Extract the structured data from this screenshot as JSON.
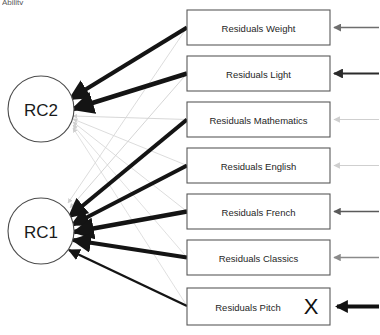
{
  "diagram": {
    "type": "factor-analysis-path-diagram",
    "top_clipped_fragment": "Ability",
    "latent_factors": [
      {
        "id": "RC2",
        "label": "RC2",
        "cx": 41,
        "cy": 109,
        "r": 33
      },
      {
        "id": "RC1",
        "label": "RC1",
        "cx": 41,
        "cy": 231,
        "r": 33
      }
    ],
    "manifest_variables": [
      {
        "id": "weight",
        "label": "Residuals Weight",
        "x": 187,
        "y": 10,
        "w": 143,
        "h": 35
      },
      {
        "id": "light",
        "label": "Residuals Light",
        "x": 187,
        "y": 56,
        "w": 143,
        "h": 35
      },
      {
        "id": "mathematics",
        "label": "Residuals Mathematics",
        "x": 187,
        "y": 102,
        "w": 143,
        "h": 35
      },
      {
        "id": "english",
        "label": "Residuals English",
        "x": 187,
        "y": 148,
        "w": 143,
        "h": 35
      },
      {
        "id": "french",
        "label": "Residuals French",
        "x": 187,
        "y": 194,
        "w": 143,
        "h": 35
      },
      {
        "id": "classics",
        "label": "Residuals Classics",
        "x": 187,
        "y": 240,
        "w": 143,
        "h": 35
      },
      {
        "id": "pitch",
        "label": "Residuals Pitch",
        "x": 187,
        "y": 288,
        "w": 143,
        "h": 37,
        "extra_glyph": "X"
      }
    ],
    "residual_arrows": [
      {
        "target": "weight",
        "color": "#6e6e6e",
        "width": 1.6,
        "y": 28
      },
      {
        "target": "light",
        "color": "#2b2b2b",
        "width": 2.2,
        "y": 74
      },
      {
        "target": "mathematics",
        "color": "#cfcfcf",
        "width": 1.2,
        "y": 120
      },
      {
        "target": "english",
        "color": "#cfcfcf",
        "width": 1.2,
        "y": 166
      },
      {
        "target": "french",
        "color": "#5a5a5a",
        "width": 1.5,
        "y": 212
      },
      {
        "target": "classics",
        "color": "#8a8a8a",
        "width": 1.5,
        "y": 258
      },
      {
        "target": "pitch",
        "color": "#111111",
        "width": 4.0,
        "y": 307
      }
    ],
    "loadings": [
      {
        "from": "RC2",
        "to": "weight",
        "color": "#141414",
        "width": 4.2
      },
      {
        "from": "RC2",
        "to": "light",
        "color": "#141414",
        "width": 4.6
      },
      {
        "from": "RC2",
        "to": "mathematics",
        "color": "#d2d2d2",
        "width": 0.9
      },
      {
        "from": "RC2",
        "to": "english",
        "color": "#d8d8d8",
        "width": 0.9
      },
      {
        "from": "RC2",
        "to": "french",
        "color": "#d8d8d8",
        "width": 0.9
      },
      {
        "from": "RC2",
        "to": "classics",
        "color": "#dcdcdc",
        "width": 0.9
      },
      {
        "from": "RC2",
        "to": "pitch",
        "color": "#dcdcdc",
        "width": 0.9
      },
      {
        "from": "RC1",
        "to": "weight",
        "color": "#d8d8d8",
        "width": 0.9
      },
      {
        "from": "RC1",
        "to": "light",
        "color": "#d0d0d0",
        "width": 0.9
      },
      {
        "from": "RC1",
        "to": "mathematics",
        "color": "#141414",
        "width": 4.0
      },
      {
        "from": "RC1",
        "to": "english",
        "color": "#141414",
        "width": 3.8
      },
      {
        "from": "RC1",
        "to": "french",
        "color": "#141414",
        "width": 4.4
      },
      {
        "from": "RC1",
        "to": "classics",
        "color": "#141414",
        "width": 4.0
      },
      {
        "from": "RC1",
        "to": "pitch",
        "color": "#141414",
        "width": 2.4
      }
    ]
  }
}
